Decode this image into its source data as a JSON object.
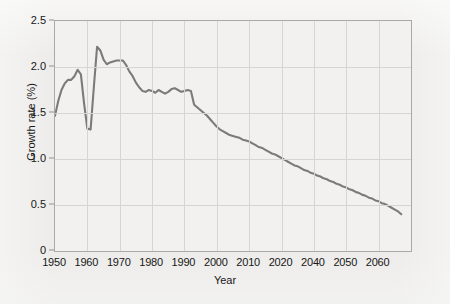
{
  "chart_data": {
    "type": "line",
    "title": "",
    "xlabel": "Year",
    "ylabel": "Growth rate (%)",
    "xlim": [
      1950,
      2060
    ],
    "ylim": [
      0,
      2.5
    ],
    "grid": true,
    "legend": "none",
    "line_color": "#7b7b79",
    "background_color": "#f2f1f0",
    "grid_color": "#d6d5d3",
    "axis_color": "#a9a9a7",
    "xticks": [
      1950,
      1960,
      1970,
      1980,
      1990,
      2000,
      2010,
      2020,
      2030,
      2040,
      2050,
      2060
    ],
    "xtick_labels": [
      "1950",
      "1960",
      "1970",
      "1980",
      "1990",
      "2000",
      "2010",
      "2020",
      "2040",
      "2050",
      "2060"
    ],
    "xtick_label_positions": [
      1950,
      1960,
      1970,
      1980,
      1990,
      2000,
      2010,
      2020,
      2030,
      2040,
      2050
    ],
    "yticks": [
      0,
      0.5,
      1.0,
      1.5,
      2.0,
      2.5
    ],
    "ytick_labels": [
      "0",
      "0.5",
      "1.0",
      "1.5",
      "2.0",
      "2.5"
    ],
    "series": [
      {
        "name": "World population growth rate",
        "x": [
          1950,
          1951,
          1952,
          1953,
          1954,
          1955,
          1956,
          1957,
          1958,
          1959,
          1960,
          1961,
          1962,
          1963,
          1964,
          1965,
          1966,
          1967,
          1968,
          1969,
          1970,
          1971,
          1972,
          1973,
          1974,
          1975,
          1976,
          1977,
          1978,
          1979,
          1980,
          1981,
          1982,
          1983,
          1984,
          1985,
          1986,
          1987,
          1988,
          1989,
          1990,
          1991,
          1992,
          1993,
          1994,
          1995,
          1996,
          1997,
          1998,
          1999,
          2000,
          2001,
          2002,
          2003,
          2004,
          2005,
          2006,
          2007,
          2008,
          2009,
          2010,
          2011,
          2012,
          2013,
          2014,
          2015,
          2016,
          2017,
          2018,
          2019,
          2020,
          2021,
          2022,
          2023,
          2024,
          2025,
          2026,
          2027,
          2028,
          2029,
          2030,
          2031,
          2032,
          2033,
          2034,
          2035,
          2036,
          2037,
          2038,
          2039,
          2040,
          2041,
          2042,
          2043,
          2044,
          2045,
          2046,
          2047,
          2048,
          2049,
          2050,
          2051,
          2052,
          2053,
          2054,
          2055,
          2056,
          2057
        ],
        "y": [
          1.47,
          1.63,
          1.75,
          1.82,
          1.86,
          1.86,
          1.9,
          1.97,
          1.92,
          1.6,
          1.33,
          1.32,
          1.78,
          2.22,
          2.18,
          2.08,
          2.03,
          2.05,
          2.06,
          2.07,
          2.07,
          2.07,
          2.02,
          1.95,
          1.9,
          1.83,
          1.78,
          1.74,
          1.73,
          1.75,
          1.74,
          1.72,
          1.75,
          1.73,
          1.71,
          1.73,
          1.76,
          1.77,
          1.75,
          1.73,
          1.74,
          1.75,
          1.74,
          1.59,
          1.56,
          1.53,
          1.5,
          1.47,
          1.43,
          1.39,
          1.35,
          1.32,
          1.3,
          1.28,
          1.26,
          1.25,
          1.24,
          1.23,
          1.21,
          1.2,
          1.19,
          1.17,
          1.15,
          1.13,
          1.12,
          1.1,
          1.08,
          1.06,
          1.05,
          1.03,
          1.01,
          0.99,
          0.97,
          0.95,
          0.93,
          0.92,
          0.9,
          0.88,
          0.87,
          0.85,
          0.84,
          0.82,
          0.81,
          0.79,
          0.78,
          0.76,
          0.75,
          0.73,
          0.72,
          0.7,
          0.69,
          0.67,
          0.66,
          0.64,
          0.63,
          0.61,
          0.6,
          0.58,
          0.57,
          0.55,
          0.54,
          0.52,
          0.51,
          0.49,
          0.47,
          0.45,
          0.43,
          0.4
        ]
      }
    ]
  }
}
